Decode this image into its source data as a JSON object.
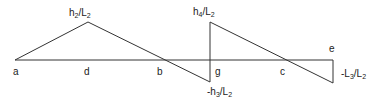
{
  "diagram": {
    "type": "influence-line",
    "stroke_color": "#333333",
    "points": {
      "a": "a",
      "d": "d",
      "b": "b",
      "g": "g",
      "c": "c",
      "e": "e"
    },
    "ordinates": {
      "peak_d": {
        "num": "h",
        "num_sub": "2",
        "den": "L",
        "den_sub": "2"
      },
      "peak_g_top": {
        "num": "h",
        "num_sub": "4",
        "den": "L",
        "den_sub": "2"
      },
      "peak_g_bottom": {
        "prefix": "-",
        "num": "h",
        "num_sub": "3",
        "den": "L",
        "den_sub": "2"
      },
      "end_e": {
        "prefix": "-",
        "num": "L",
        "num_sub": "3",
        "den": "L",
        "den_sub": "2"
      }
    }
  }
}
